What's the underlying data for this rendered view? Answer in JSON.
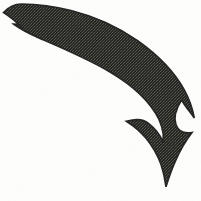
{
  "image": {
    "kind": "clip-art",
    "subject": "curved-down-arrow",
    "title": "Curved arrow pointing down",
    "width": 201,
    "height": 201,
    "background_color": "#fdfdfc",
    "ink_color": "#2b2a29",
    "ink_texture": "dithered-halftone",
    "direction": "down",
    "curve": "sweeps from upper-left, bends right and turns downward",
    "parts": [
      {
        "name": "tail",
        "label": "tail",
        "description": "thin pointed tail at upper left with a concave swallow notch"
      },
      {
        "name": "shaft",
        "label": "shaft",
        "description": "tapered curved band sweeping right then down"
      },
      {
        "name": "head",
        "label": "arrowhead",
        "description": "barbed arrowhead with two upswept barbs and a downward point"
      },
      {
        "name": "barb-left",
        "label": "left barb",
        "description": "upswept hook on the left of the head"
      },
      {
        "name": "barb-right",
        "label": "right barb",
        "description": "upswept hook on the right of the head"
      }
    ],
    "key_points": {
      "tail_tip": "3, 13",
      "bend": "160, 95",
      "barb_left_tip": "126, 121",
      "barb_right_tip": "194, 118",
      "arrow_point": "166, 187"
    }
  }
}
